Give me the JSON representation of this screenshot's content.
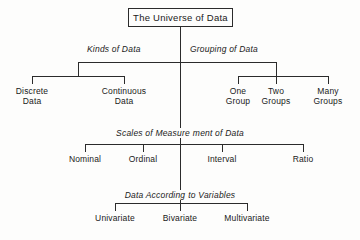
{
  "diagram": {
    "title": "The Universe of Data",
    "root": {
      "label": "The Universe of Data"
    },
    "tiers": [
      {
        "name": "kinds-and-grouping",
        "captions": [
          {
            "id": "kinds-of-data",
            "text": "Kinds of Data"
          },
          {
            "id": "grouping-of-data",
            "text": "Grouping of Data"
          }
        ],
        "leaves": [
          {
            "id": "discrete-data",
            "line1": "Discrete",
            "line2": "Data"
          },
          {
            "id": "continuous-data",
            "line1": "Continuous",
            "line2": "Data"
          },
          {
            "id": "one-group",
            "line1": "One",
            "line2": "Group"
          },
          {
            "id": "two-groups",
            "line1": "Two",
            "line2": "Groups"
          },
          {
            "id": "many-groups",
            "line1": "Many",
            "line2": "Groups"
          }
        ]
      },
      {
        "name": "scales-of-measurement",
        "caption": {
          "id": "scales-of-measurement-of-data",
          "text": "Scales of Measurement of Data",
          "part1": "Scales of Measure",
          "part2": "ment of Data"
        },
        "leaves": [
          {
            "id": "nominal",
            "line1": "Nominal"
          },
          {
            "id": "ordinal",
            "line1": "Ordinal"
          },
          {
            "id": "interval",
            "line1": "Interval"
          },
          {
            "id": "ratio",
            "line1": "Ratio"
          }
        ]
      },
      {
        "name": "data-according-to-variables",
        "caption": {
          "id": "data-according-to-variables",
          "text": "Data According to Variables",
          "part1": "Data According",
          "part2": "to Variables"
        },
        "leaves": [
          {
            "id": "univariate",
            "line1": "Univariate"
          },
          {
            "id": "bivariate",
            "line1": "Bivariate"
          },
          {
            "id": "multivariate",
            "line1": "Multivariate"
          }
        ]
      }
    ],
    "colors": {
      "ink": "#2b2b2b",
      "paper": "#fdfdfc"
    }
  }
}
